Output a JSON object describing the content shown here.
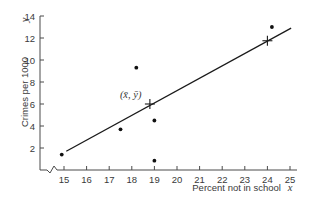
{
  "chart_data": {
    "type": "scatter",
    "title": "",
    "xlabel": "Percent not in school",
    "xlabel_var": "x",
    "ylabel": "Crimes per 1000",
    "ylabel_var": "y",
    "xlim": [
      14.2,
      25.3
    ],
    "ylim": [
      0,
      14
    ],
    "x_axis_break": true,
    "grid": false,
    "xticks": [
      15,
      16,
      17,
      18,
      19,
      20,
      21,
      22,
      23,
      24,
      25
    ],
    "yticks": [
      2,
      4,
      6,
      8,
      10,
      12,
      14
    ],
    "points": [
      {
        "x": 14.9,
        "y": 1.4
      },
      {
        "x": 17.5,
        "y": 3.7
      },
      {
        "x": 18.2,
        "y": 9.3
      },
      {
        "x": 19.0,
        "y": 4.5
      },
      {
        "x": 19.0,
        "y": 0.85
      },
      {
        "x": 24.2,
        "y": 13.0
      }
    ],
    "regression_line": {
      "x_start": 15.1,
      "y_start": 1.7,
      "x_end": 25.05,
      "y_end": 12.9
    },
    "markers": [
      {
        "name": "mean-point",
        "x": 18.8,
        "y": 6.0,
        "label": "(x̄, ȳ)"
      },
      {
        "name": "predicted-point",
        "x": 24.0,
        "y": 11.75,
        "label": ""
      }
    ],
    "colors": {
      "axis": "#4a4a4a",
      "line": "#1a1a1a",
      "points": "#111111"
    }
  }
}
